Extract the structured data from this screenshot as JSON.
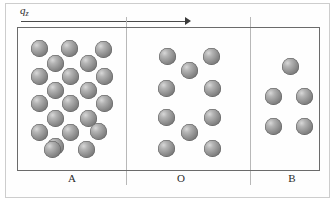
{
  "figure": {
    "axis_label": "q",
    "axis_label_subscript": "z",
    "arrow_direction": "right",
    "arrow_start_x": 21,
    "arrow_end_x": 191,
    "arrow_y": 21
  },
  "regions": [
    {
      "id": "A",
      "label": "A",
      "particle_count": 21,
      "description": "dense phase",
      "particles": [
        {
          "x": 31,
          "y": 40
        },
        {
          "x": 61,
          "y": 40
        },
        {
          "x": 95,
          "y": 41
        },
        {
          "x": 47,
          "y": 55
        },
        {
          "x": 80,
          "y": 55
        },
        {
          "x": 31,
          "y": 68
        },
        {
          "x": 62,
          "y": 68
        },
        {
          "x": 96,
          "y": 68
        },
        {
          "x": 47,
          "y": 82
        },
        {
          "x": 80,
          "y": 82
        },
        {
          "x": 31,
          "y": 95
        },
        {
          "x": 62,
          "y": 95
        },
        {
          "x": 96,
          "y": 95
        },
        {
          "x": 47,
          "y": 110
        },
        {
          "x": 80,
          "y": 110
        },
        {
          "x": 31,
          "y": 124
        },
        {
          "x": 62,
          "y": 124
        },
        {
          "x": 47,
          "y": 138
        },
        {
          "x": 90,
          "y": 123
        },
        {
          "x": 44,
          "y": 141
        },
        {
          "x": 78,
          "y": 141
        }
      ]
    },
    {
      "id": "O",
      "label": "O",
      "particle_count": 10,
      "description": "intermediate phase",
      "particles": [
        {
          "x": 159,
          "y": 48
        },
        {
          "x": 203,
          "y": 48
        },
        {
          "x": 181,
          "y": 62
        },
        {
          "x": 158,
          "y": 80
        },
        {
          "x": 204,
          "y": 80
        },
        {
          "x": 158,
          "y": 109
        },
        {
          "x": 204,
          "y": 109
        },
        {
          "x": 181,
          "y": 124
        },
        {
          "x": 158,
          "y": 140
        },
        {
          "x": 204,
          "y": 140
        }
      ]
    },
    {
      "id": "B",
      "label": "B",
      "particle_count": 5,
      "description": "dilute phase",
      "particles": [
        {
          "x": 282,
          "y": 58
        },
        {
          "x": 265,
          "y": 88
        },
        {
          "x": 296,
          "y": 88
        },
        {
          "x": 265,
          "y": 118
        },
        {
          "x": 296,
          "y": 118
        }
      ]
    }
  ],
  "colors": {
    "particle_light": "#d8d8d8",
    "particle_dark": "#5d5d5d",
    "inner_box_border": "#6b6b6b",
    "outer_frame_border": "#cdcdcd",
    "divider": "#b8b8b8",
    "arrow": "#3a3a3a",
    "text": "#2b2b2b"
  }
}
